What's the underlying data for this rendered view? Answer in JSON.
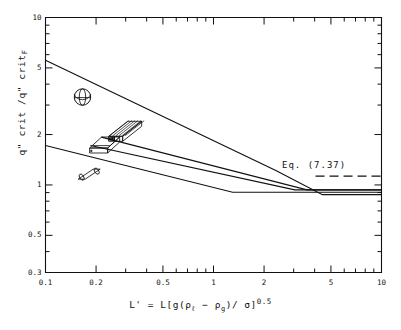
{
  "figure": {
    "background": "#ffffff",
    "ink": "#111111"
  },
  "chart_data": {
    "type": "line",
    "title": "",
    "subtitle": "",
    "xlabel": "L' = L[g(ρℓ - ρg)/ σ]^0.5",
    "ylabel": "q\" crit /q\" critF",
    "xscale": "log",
    "yscale": "log",
    "xlim": [
      0.1,
      10
    ],
    "ylim": [
      0.3,
      10
    ],
    "grid": false,
    "legend": "none",
    "xticks": [
      0.1,
      0.2,
      0.5,
      1,
      2,
      5,
      10
    ],
    "xtick_labels": [
      "0.1",
      "0.2",
      "0.5",
      "1",
      "2",
      "5",
      "10"
    ],
    "yticks": [
      0.3,
      0.5,
      1,
      2,
      5,
      10
    ],
    "ytick_labels": [
      "0.3",
      "0.5",
      "1",
      "2",
      "5",
      "10"
    ],
    "xminor": [
      0.3,
      0.4,
      0.6,
      0.7,
      0.8,
      0.9,
      3,
      4,
      6,
      7,
      8,
      9
    ],
    "yminor": [
      0.4,
      0.6,
      0.7,
      0.8,
      0.9,
      3,
      4,
      6,
      7,
      8,
      9
    ],
    "series": [
      {
        "name": "sphere",
        "style": "solid",
        "points": [
          [
            0.1,
            5.55
          ],
          [
            2.35,
            1.22
          ],
          [
            4.45,
            0.875
          ],
          [
            10.0,
            0.875
          ]
        ]
      },
      {
        "name": "large-ribbed-block",
        "style": "solid",
        "points": [
          [
            0.215,
            1.93
          ],
          [
            3.6,
            0.935
          ],
          [
            10.0,
            0.935
          ]
        ]
      },
      {
        "name": "small-flat-block",
        "style": "solid",
        "points": [
          [
            0.185,
            1.72
          ],
          [
            3.05,
            0.935
          ],
          [
            10.0,
            0.935
          ]
        ]
      },
      {
        "name": "cylinder",
        "style": "solid",
        "points": [
          [
            0.1,
            1.72
          ],
          [
            1.3,
            0.905
          ],
          [
            10.0,
            0.905
          ]
        ]
      },
      {
        "name": "Eq. (7.37)",
        "style": "dashed",
        "points": [
          [
            4.05,
            1.13
          ],
          [
            10.0,
            1.13
          ]
        ]
      }
    ],
    "annotations": [
      {
        "name": "eq-737-label",
        "text": "Eq.  (7.37)",
        "x": 4.7,
        "y": 1.38
      }
    ],
    "shape_icons": [
      {
        "name": "sphere-icon",
        "x": 0.166,
        "y": 3.35
      },
      {
        "name": "ribbed-block-icon",
        "x": 0.3,
        "y": 2.12
      },
      {
        "name": "flat-block-icon",
        "x": 0.225,
        "y": 1.78
      },
      {
        "name": "cylinder-icon",
        "x": 0.182,
        "y": 1.16
      }
    ]
  },
  "axis": {
    "eq_annotation": "Eq.  (7.37)",
    "y_title_main": "q\" crit /q\" crit",
    "y_title_sub": "F",
    "x_title_prefix": "L' = L[g(",
    "x_title_rho1": "ρ",
    "x_title_sub1": "ℓ",
    "x_title_mid": " − ",
    "x_title_rho2": "ρ",
    "x_title_sub2": "g",
    "x_title_suffix": ")/ σ]",
    "x_title_exp": "0.5"
  }
}
